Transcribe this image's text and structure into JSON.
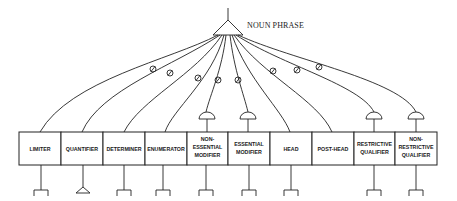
{
  "diagram": {
    "root": {
      "label": "NOUN PHRASE",
      "symbol": "triangle"
    },
    "constituents": [
      {
        "label_lines": [
          "LIMITER"
        ],
        "optional": true,
        "connector": "line",
        "bottom_symbol": "bracket"
      },
      {
        "label_lines": [
          "QUANTIFIER"
        ],
        "optional": true,
        "connector": "line",
        "bottom_symbol": "triangle"
      },
      {
        "label_lines": [
          "DETERMINER"
        ],
        "optional": true,
        "connector": "line",
        "bottom_symbol": "bracket"
      },
      {
        "label_lines": [
          "ENUMERATOR"
        ],
        "optional": true,
        "connector": "line",
        "bottom_symbol": "bracket"
      },
      {
        "label_lines": [
          "NON-",
          "ESSENTIAL",
          "MODIFIER"
        ],
        "optional": true,
        "connector": "semicircle",
        "bottom_symbol": "bracket"
      },
      {
        "label_lines": [
          "ESSENTIAL",
          "MODIFIER"
        ],
        "optional": true,
        "connector": "semicircle",
        "bottom_symbol": "bracket"
      },
      {
        "label_lines": [
          "HEAD"
        ],
        "optional": false,
        "connector": "line",
        "bottom_symbol": "bracket"
      },
      {
        "label_lines": [
          "POST-HEAD"
        ],
        "optional": true,
        "connector": "line",
        "bottom_symbol": "none"
      },
      {
        "label_lines": [
          "RESTRICTIVE",
          "QUALIFIER"
        ],
        "optional": true,
        "connector": "semicircle",
        "bottom_symbol": "bracket"
      },
      {
        "label_lines": [
          "NON-",
          "RESTRICTIVE",
          "QUALIFIER"
        ],
        "optional": true,
        "connector": "semicircle",
        "bottom_symbol": "bracket"
      }
    ],
    "legend_symbols": {
      "optional_marker": "circle-with-slash",
      "multiple_marker": "semicircle",
      "terminal_marker": "bracket",
      "phrase_marker": "triangle"
    }
  }
}
